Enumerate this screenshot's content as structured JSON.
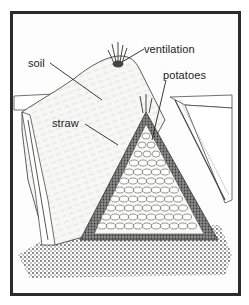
{
  "diagram": {
    "labels": [
      {
        "id": "soil",
        "text": "soil",
        "x": 28,
        "y": 56
      },
      {
        "id": "ventilation",
        "text": "ventilation",
        "x": 144,
        "y": 44
      },
      {
        "id": "potatoes",
        "text": "potatoes",
        "x": 163,
        "y": 70
      },
      {
        "id": "straw",
        "text": "straw",
        "x": 52,
        "y": 117
      }
    ],
    "colors": {
      "frame": "#2b2b2b",
      "ink": "#333333",
      "soil_fill": "#f4f4f2",
      "straw_fill": "#7a7a7a",
      "potato_fill": "#f8f8f6",
      "ground_fill": "#9a9a9a"
    }
  }
}
